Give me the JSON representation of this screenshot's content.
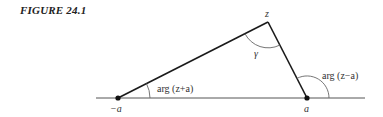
{
  "figure": {
    "caption": "FIGURE 24.1"
  },
  "diagram": {
    "points": {
      "z": {
        "label": "z"
      },
      "minus_a": {
        "label": "−a"
      },
      "a": {
        "label": "a"
      }
    },
    "angles": {
      "gamma": {
        "label": "γ"
      },
      "arg_z_plus_a": {
        "label": "arg (z+a)"
      },
      "arg_z_minus_a": {
        "label": "arg (z−a)"
      }
    },
    "colors": {
      "line": "#1a1a1a",
      "axis": "#555555",
      "arc": "#666666",
      "text": "#333333"
    }
  }
}
